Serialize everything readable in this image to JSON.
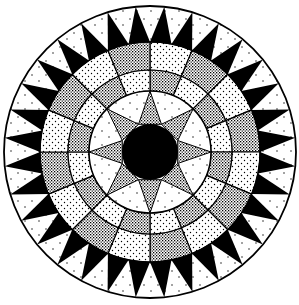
{
  "figure": {
    "center": [
      150,
      152
    ],
    "colors": {
      "ink": "#000000",
      "paper": "#ffffff",
      "dense_stipple": "#6e6e6e",
      "light_stipple": "#e4e4e4",
      "star_point": "#5a5a5a"
    },
    "rings": {
      "outer_radius": 146,
      "sawtooth_inner_radius": 110,
      "checker_mid_radius": 82,
      "star_ring_radius": 61,
      "center_disk_radius": 28
    },
    "sawtooth": {
      "teeth": 32,
      "offset_deg": 0
    },
    "outer_checker": {
      "segments": 16,
      "offset_deg": 0,
      "first": "light"
    },
    "inner_checker": {
      "segments": 16,
      "offset_deg": 0,
      "first": "dense"
    },
    "star": {
      "points": 8,
      "offset_deg": 0,
      "half_width_deg": 22.5
    }
  }
}
